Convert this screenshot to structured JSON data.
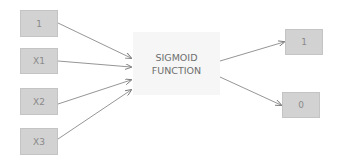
{
  "diagram": {
    "inputs": [
      {
        "id": "bias",
        "label": "1"
      },
      {
        "id": "x1",
        "label": "X1"
      },
      {
        "id": "x2",
        "label": "X2"
      },
      {
        "id": "x3",
        "label": "X3"
      }
    ],
    "function": {
      "line1": "SIGMOID",
      "line2": "FUNCTION"
    },
    "outputs": [
      {
        "id": "out-1",
        "label": "1"
      },
      {
        "id": "out-0",
        "label": "0"
      }
    ],
    "colors": {
      "box_fill": "#d2d2d2",
      "function_fill": "#f6f6f6",
      "arrow": "#7a7a7a",
      "text": "#8a8a8a"
    }
  }
}
